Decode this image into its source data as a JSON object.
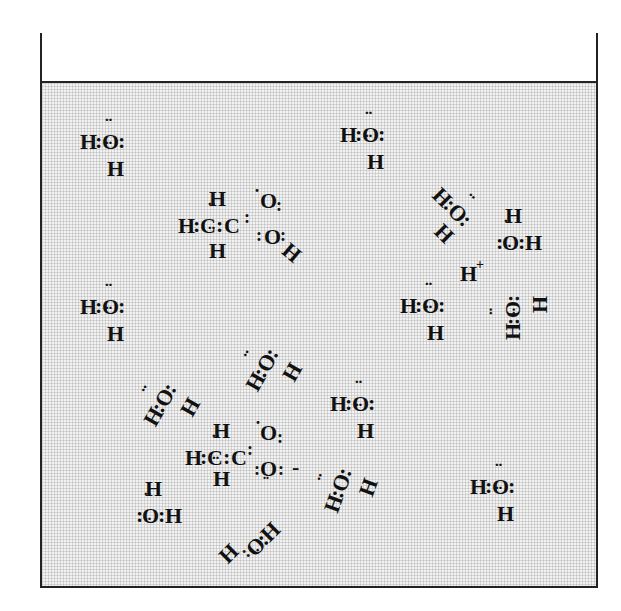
{
  "diagram": {
    "title": "",
    "container": "beaker",
    "solution": "aqueous acetic acid",
    "species": {
      "water": {
        "O": "O",
        "H": "H",
        "bond": ":"
      },
      "hydronium_ion": {
        "symbol": "H",
        "charge": "+"
      },
      "acetic_acid": {
        "C": "C",
        "O": "O",
        "H": "H",
        "bond": ":"
      },
      "acetate_ion": {
        "C": "C",
        "O": "O",
        "H": "H",
        "bond": ":",
        "charge": "-"
      }
    },
    "molecules": [
      {
        "id": "water-1",
        "type": "water",
        "orientation": "H:O: / H below"
      },
      {
        "id": "water-2",
        "type": "water",
        "orientation": "H:O: / H below"
      },
      {
        "id": "acetic-acid",
        "type": "acetic_acid",
        "formula": "H3C-COOH"
      },
      {
        "id": "water-3",
        "type": "water",
        "orientation": "rotated"
      },
      {
        "id": "water-4",
        "type": "water",
        "orientation": "H above / :O:H"
      },
      {
        "id": "hydrogen-ion",
        "type": "hydronium_ion",
        "label": "H+"
      },
      {
        "id": "water-5",
        "type": "water",
        "orientation": "H:O: / H below"
      },
      {
        "id": "water-6",
        "type": "water",
        "orientation": "H:O: / H below"
      },
      {
        "id": "water-7",
        "type": "water",
        "orientation": "rotated 90"
      },
      {
        "id": "water-8",
        "type": "water",
        "orientation": "rotated"
      },
      {
        "id": "water-9",
        "type": "water",
        "orientation": "rotated"
      },
      {
        "id": "water-10",
        "type": "water",
        "orientation": "H:O: / H below"
      },
      {
        "id": "acetate",
        "type": "acetate_ion",
        "formula": "H3C-COO-"
      },
      {
        "id": "water-11",
        "type": "water",
        "orientation": "H above / :O:H"
      },
      {
        "id": "water-12",
        "type": "water",
        "orientation": "rotated"
      },
      {
        "id": "water-13",
        "type": "water",
        "orientation": "rotated"
      },
      {
        "id": "water-14",
        "type": "water",
        "orientation": "H:O: / H below"
      }
    ]
  }
}
